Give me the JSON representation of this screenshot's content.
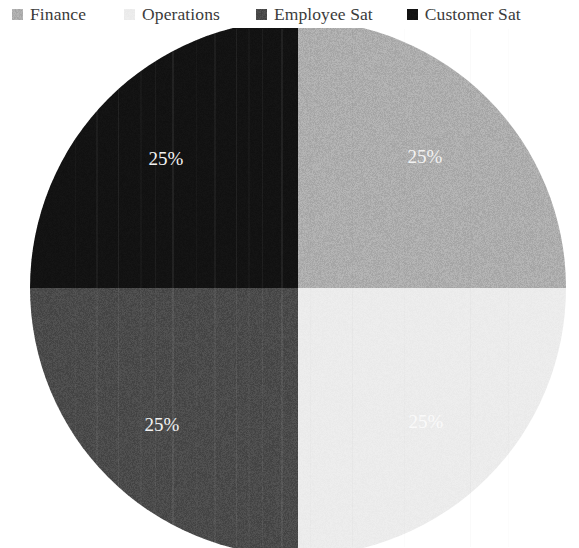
{
  "legend": {
    "position": "top",
    "items": [
      {
        "label": "Finance",
        "swatch_color": "#adadad",
        "icon": "legend-swatch-icon"
      },
      {
        "label": "Operations",
        "swatch_color": "#ececec",
        "icon": "legend-swatch-icon"
      },
      {
        "label": "Employee Sat",
        "swatch_color": "#4a4a4a",
        "icon": "legend-swatch-icon"
      },
      {
        "label": "Customer Sat",
        "swatch_color": "#121212",
        "icon": "legend-swatch-icon"
      }
    ]
  },
  "chart_data": {
    "type": "pie",
    "title": "",
    "categories": [
      "Finance",
      "Operations",
      "Employee Sat",
      "Customer Sat"
    ],
    "values": [
      25,
      25,
      25,
      25
    ],
    "value_unit": "%",
    "data_labels": [
      "25%",
      "25%",
      "25%",
      "25%"
    ],
    "colors": [
      "#adadad",
      "#ececec",
      "#4a4a4a",
      "#121212"
    ],
    "legend_position": "top",
    "grid": false,
    "xlabel": "",
    "ylabel": "",
    "slices": [
      {
        "name": "Customer Sat",
        "value": 25,
        "label": "25%",
        "color": "#121212",
        "quadrant": "top-left",
        "start_angle": 270,
        "end_angle": 360
      },
      {
        "name": "Finance",
        "value": 25,
        "label": "25%",
        "color": "#adadad",
        "quadrant": "top-right",
        "start_angle": 0,
        "end_angle": 90
      },
      {
        "name": "Operations",
        "value": 25,
        "label": "25%",
        "color": "#ececec",
        "quadrant": "bottom-right",
        "start_angle": 90,
        "end_angle": 180
      },
      {
        "name": "Employee Sat",
        "value": 25,
        "label": "25%",
        "color": "#4a4a4a",
        "quadrant": "bottom-left",
        "start_angle": 180,
        "end_angle": 270
      }
    ],
    "label_positions": [
      {
        "x": 166,
        "y": 161
      },
      {
        "x": 425,
        "y": 159
      },
      {
        "x": 162,
        "y": 427
      },
      {
        "x": 426,
        "y": 424
      }
    ]
  },
  "canvas": {
    "background": "#ffffff",
    "text_color": "#3b3b3b",
    "label_text_color": "#f2f2f2"
  }
}
